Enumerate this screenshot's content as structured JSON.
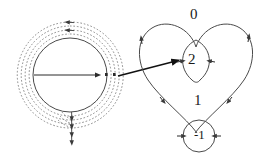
{
  "figure": {
    "stroke_color": "#4a4a4a",
    "dotted_color": "#7a7a7a",
    "arrow_color": "#111111",
    "label_color": "#1a1a1a",
    "background": "#ffffff"
  },
  "left_panel": {
    "name": "source-circle-with-spirals",
    "center": {
      "x": 70,
      "y": 75
    },
    "solid_circle_radius": 37,
    "dotted_arc_radii": [
      41,
      45,
      49,
      53
    ],
    "radial_line": {
      "from_x": 34,
      "from_y": 75,
      "to_x": 100,
      "to_y": 75
    },
    "arrowheads": 10
  },
  "right_panel": {
    "name": "heart-curve-regions",
    "regions": [
      {
        "id": "region-0",
        "label": "0",
        "x": 190,
        "y": 7,
        "description": "outer region winding number zero"
      },
      {
        "id": "region-2",
        "label": "2",
        "x": 188,
        "y": 52,
        "description": "inner lobe winding number two"
      },
      {
        "id": "region-1",
        "label": "1",
        "x": 194,
        "y": 93,
        "description": "main body winding number one"
      },
      {
        "id": "region-minus1",
        "label": "-1",
        "x": 194,
        "y": 128,
        "description": "small bottom loop winding number minus one"
      }
    ]
  },
  "connector": {
    "name": "mapping-arrow",
    "from_x": 118,
    "from_y": 76,
    "to_x": 179,
    "to_y": 60
  }
}
